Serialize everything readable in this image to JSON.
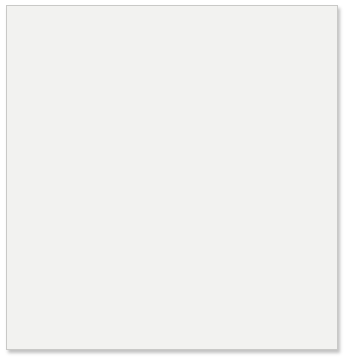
{
  "figure": {
    "background_color": "#f2f2f0",
    "border_color": "#c9c9c7"
  },
  "chart_data": {
    "type": "scatter",
    "title": "",
    "subtitle": "",
    "xlabel": "Year",
    "ylabel": "Change in mean sea level (mm)",
    "xlim": [
      1992.7,
      2005.6
    ],
    "ylim": [
      0,
      52
    ],
    "xticks": [
      1995,
      2000,
      2005
    ],
    "xtick_labels": [
      "1995",
      "2000",
      "2005"
    ],
    "yticks": [
      0,
      10,
      20,
      30,
      40,
      50
    ],
    "ytick_labels": [
      "0",
      "10",
      "20",
      "30",
      "40",
      "50"
    ],
    "grid": true,
    "grid_color": "#ffffff",
    "minor_grid": true,
    "plot_background": "#b0b0b0",
    "legend": "none",
    "annotations": [
      {
        "text": "60-day average",
        "x": 2001.0,
        "y": 45.6,
        "points_to_x": 2002.65,
        "points_to_y": 44.6
      },
      {
        "text": "Trend",
        "x": 1997.9,
        "y": 29.0,
        "points_to_x": 1998.75,
        "points_to_y": 24.6
      }
    ],
    "series": [
      {
        "name": "Monthly observations",
        "type": "scatter",
        "marker_color": "#6b6b6b",
        "marker_size": 2.1,
        "x": [
          1993.05,
          1993.08,
          1993.14,
          1993.2,
          1993.26,
          1993.33,
          1993.4,
          1993.47,
          1993.55,
          1993.62,
          1993.7,
          1993.78,
          1993.85,
          1993.92,
          1994.0,
          1994.08,
          1994.16,
          1994.24,
          1994.32,
          1994.4,
          1994.48,
          1994.56,
          1994.64,
          1994.72,
          1994.8,
          1994.88,
          1994.96,
          1995.04,
          1995.12,
          1995.2,
          1995.28,
          1995.36,
          1995.44,
          1995.52,
          1995.6,
          1995.68,
          1995.76,
          1995.84,
          1995.92,
          1996.0,
          1996.08,
          1996.16,
          1996.24,
          1996.32,
          1996.4,
          1996.48,
          1996.56,
          1996.64,
          1996.72,
          1996.8,
          1996.88,
          1996.96,
          1997.04,
          1997.12,
          1997.2,
          1997.28,
          1997.36,
          1997.44,
          1997.52,
          1997.6,
          1997.68,
          1997.76,
          1997.84,
          1997.92,
          1998.0,
          1998.08,
          1998.16,
          1998.24,
          1998.32,
          1998.4,
          1998.48,
          1998.56,
          1998.64,
          1998.72,
          1998.8,
          1998.88,
          1998.96,
          1999.04,
          1999.12,
          1999.2,
          1999.28,
          1999.36,
          1999.44,
          1999.52,
          1999.6,
          1999.68,
          1999.76,
          1999.84,
          1999.92,
          2000.0,
          2000.08,
          2000.16,
          2000.24,
          2000.32,
          2000.4,
          2000.48,
          2000.56,
          2000.64,
          2000.72,
          2000.8,
          2000.88,
          2000.96,
          2001.04,
          2001.12,
          2001.2,
          2001.28,
          2001.36,
          2001.44,
          2001.52,
          2001.6,
          2001.68,
          2001.76,
          2001.84,
          2001.92,
          2002.0,
          2002.08,
          2002.16,
          2002.24,
          2002.32,
          2002.4,
          2002.48,
          2002.56,
          2002.64,
          2002.72,
          2002.8,
          2002.88,
          2002.96,
          2003.04,
          2003.12,
          2003.2,
          2003.28,
          2003.36,
          2003.44,
          2003.52,
          2003.6,
          2003.68,
          2003.76,
          2003.84,
          2003.92,
          2004.0,
          2004.08,
          2004.16,
          2004.24,
          2004.32,
          2004.4,
          2004.48,
          2004.56,
          2004.64,
          2004.72,
          2004.8,
          2004.88,
          2004.96,
          2005.04,
          2005.12,
          2005.2,
          2005.28,
          2005.36,
          2005.44
        ],
        "y": [
          9.8,
          4.6,
          14.8,
          11.3,
          15.6,
          10.2,
          12.6,
          7.8,
          13.1,
          16.8,
          10.4,
          15.9,
          12.2,
          8.4,
          16.2,
          11.0,
          14.3,
          5.3,
          9.1,
          13.8,
          17.6,
          12.0,
          7.2,
          15.0,
          10.7,
          13.4,
          18.0,
          11.6,
          16.4,
          9.4,
          14.0,
          12.8,
          17.2,
          10.1,
          21.8,
          13.6,
          15.4,
          6.2,
          11.9,
          16.0,
          19.4,
          12.4,
          14.6,
          9.9,
          17.8,
          13.0,
          15.2,
          20.6,
          11.4,
          16.6,
          13.9,
          18.4,
          12.1,
          21.0,
          14.4,
          17.0,
          22.4,
          15.8,
          19.0,
          12.6,
          26.8,
          18.2,
          24.0,
          16.4,
          27.4,
          20.2,
          23.6,
          18.8,
          25.0,
          21.4,
          17.4,
          24.6,
          20.0,
          13.2,
          22.8,
          16.2,
          19.6,
          15.4,
          23.0,
          18.0,
          24.8,
          20.8,
          22.0,
          17.2,
          25.6,
          21.2,
          19.2,
          28.6,
          23.4,
          20.4,
          27.0,
          24.2,
          29.8,
          22.6,
          31.0,
          25.4,
          19.8,
          28.0,
          23.8,
          26.6,
          30.4,
          24.4,
          29.0,
          27.6,
          32.2,
          25.8,
          30.8,
          28.4,
          21.6,
          33.0,
          26.2,
          31.6,
          29.4,
          35.6,
          27.8,
          32.6,
          30.2,
          38.8,
          28.8,
          34.0,
          31.8,
          36.4,
          29.6,
          33.4,
          35.0,
          30.6,
          37.2,
          32.0,
          44.6,
          38.0,
          34.6,
          40.2,
          35.8,
          41.4,
          33.8,
          39.0,
          36.8,
          42.0,
          34.2,
          40.6,
          37.4,
          43.2,
          35.2,
          41.0,
          38.6,
          47.4,
          36.0,
          42.6,
          39.4,
          33.6,
          44.0,
          40.8,
          37.8,
          49.6,
          43.6,
          41.6,
          38.2,
          45.0
        ]
      },
      {
        "name": "60-day average",
        "type": "line",
        "line_color": "#5a5a5a",
        "line_width": 1.0,
        "description": "Jagged high-frequency 60-day running mean oscillating about the trend, rising from about 11 mm in 1993 to about 44 mm in 2005"
      },
      {
        "name": "Trend",
        "type": "line",
        "line_color": "#2b2b2b",
        "line_width": 1.4,
        "slope_mm_per_year": 3.05,
        "start": {
          "x": 1992.95,
          "y": 6.9
        },
        "end": {
          "x": 2005.5,
          "y": 44.2
        }
      }
    ]
  }
}
